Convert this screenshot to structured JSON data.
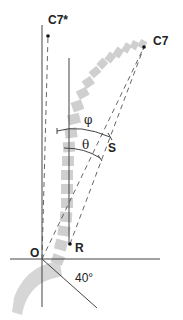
{
  "diagram": {
    "labels": {
      "c7_star": "C7*",
      "c7": "C7",
      "phi": "φ",
      "theta": "θ",
      "s": "S",
      "r": "R",
      "o": "O",
      "angle": "40°"
    },
    "colors": {
      "line": "#444444",
      "vertebra": "#cfcfcf",
      "sacrum": "#d6d6d6",
      "text": "#222222"
    }
  }
}
